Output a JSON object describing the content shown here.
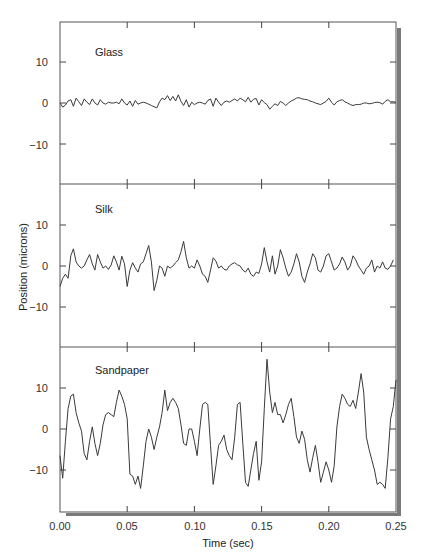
{
  "chart_data": {
    "type": "line",
    "title": "",
    "xlabel": "Time (sec)",
    "ylabel": "Position (microns)",
    "xlim": [
      0.0,
      0.25
    ],
    "x_ticks": [
      "0.00",
      "0.05",
      "0.10",
      "0.15",
      "0.20",
      "0.25"
    ],
    "x_tick_values": [
      0.0,
      0.05,
      0.1,
      0.15,
      0.2,
      0.25
    ],
    "y_ticks": [
      "10",
      "0",
      "−10"
    ],
    "y_tick_values": [
      10,
      0,
      -10
    ],
    "ylim_per_panel": [
      -19.5,
      19.5
    ],
    "grid": false,
    "legend": null,
    "layout": "3 vertically stacked panels sharing x axis",
    "panels": [
      {
        "name": "Glass",
        "series": {
          "x": [
            0.0,
            0.002,
            0.004,
            0.006,
            0.008,
            0.01,
            0.012,
            0.014,
            0.016,
            0.018,
            0.02,
            0.022,
            0.024,
            0.026,
            0.028,
            0.03,
            0.032,
            0.034,
            0.036,
            0.038,
            0.04,
            0.042,
            0.044,
            0.046,
            0.048,
            0.05,
            0.052,
            0.054,
            0.056,
            0.058,
            0.06,
            0.062,
            0.064,
            0.066,
            0.068,
            0.07,
            0.072,
            0.074,
            0.076,
            0.078,
            0.08,
            0.082,
            0.084,
            0.086,
            0.088,
            0.09,
            0.092,
            0.094,
            0.096,
            0.098,
            0.1,
            0.102,
            0.104,
            0.106,
            0.108,
            0.11,
            0.112,
            0.114,
            0.116,
            0.118,
            0.12,
            0.122,
            0.124,
            0.126,
            0.128,
            0.13,
            0.132,
            0.134,
            0.136,
            0.138,
            0.14,
            0.142,
            0.144,
            0.146,
            0.148,
            0.15,
            0.152,
            0.154,
            0.156,
            0.158,
            0.16,
            0.162,
            0.164,
            0.166,
            0.168,
            0.17,
            0.172,
            0.174,
            0.176,
            0.178,
            0.18,
            0.182,
            0.184,
            0.186,
            0.188,
            0.19,
            0.192,
            0.194,
            0.196,
            0.198,
            0.2,
            0.202,
            0.204,
            0.206,
            0.208,
            0.21,
            0.212,
            0.214,
            0.216,
            0.218,
            0.22,
            0.222,
            0.224,
            0.226,
            0.228,
            0.23,
            0.232,
            0.234,
            0.236,
            0.238,
            0.24,
            0.242,
            0.244,
            0.246,
            0.248,
            0.25
          ],
          "y": [
            0.0,
            -1.0,
            -0.5,
            0.5,
            0.8,
            -0.8,
            1.2,
            0.3,
            -0.6,
            1.0,
            0.2,
            -0.4,
            1.0,
            0.0,
            -0.5,
            0.8,
            0.0,
            -0.3,
            0.2,
            0.0,
            0.0,
            0.2,
            -0.2,
            1.0,
            0.0,
            -0.5,
            0.5,
            -0.8,
            0.6,
            -0.3,
            0.0,
            0.2,
            0.0,
            -0.3,
            -0.6,
            -0.9,
            -1.2,
            0.3,
            1.2,
            0.8,
            1.8,
            0.6,
            1.6,
            0.5,
            2.0,
            0.4,
            -0.6,
            0.8,
            -1.0,
            0.2,
            -0.4,
            0.0,
            0.2,
            0.0,
            -0.3,
            0.6,
            1.0,
            -0.8,
            1.2,
            0.2,
            -0.6,
            0.2,
            0.5,
            0.2,
            0.6,
            1.0,
            0.5,
            1.2,
            0.8,
            0.3,
            1.4,
            0.2,
            0.9,
            1.1,
            -0.5,
            0.8,
            0.1,
            -0.4,
            -1.5,
            -0.8,
            -0.2,
            -0.6,
            0.4,
            0.0,
            -0.6,
            0.0,
            0.5,
            0.8,
            1.2,
            1.3,
            1.0,
            0.9,
            0.8,
            0.5,
            0.3,
            0.0,
            -0.2,
            -0.4,
            0.0,
            0.4,
            1.2,
            0.2,
            -0.5,
            0.3,
            0.6,
            0.8,
            0.3,
            0.0,
            -0.4,
            -0.6,
            -0.4,
            -0.4,
            -0.3,
            0.0,
            0.0,
            -0.2,
            -0.1,
            0.1,
            0.2,
            0.1,
            -0.3,
            0.4,
            0.8,
            0.3,
            0.3,
            0.2
          ]
        }
      },
      {
        "name": "Silk",
        "series": {
          "x": [
            0.0,
            0.002,
            0.004,
            0.006,
            0.008,
            0.01,
            0.012,
            0.014,
            0.016,
            0.018,
            0.02,
            0.022,
            0.024,
            0.026,
            0.028,
            0.03,
            0.032,
            0.034,
            0.036,
            0.038,
            0.04,
            0.042,
            0.044,
            0.046,
            0.048,
            0.05,
            0.052,
            0.054,
            0.056,
            0.058,
            0.06,
            0.062,
            0.064,
            0.066,
            0.068,
            0.07,
            0.072,
            0.074,
            0.076,
            0.078,
            0.08,
            0.082,
            0.084,
            0.086,
            0.088,
            0.09,
            0.092,
            0.094,
            0.096,
            0.098,
            0.1,
            0.102,
            0.104,
            0.106,
            0.108,
            0.11,
            0.112,
            0.114,
            0.116,
            0.118,
            0.12,
            0.122,
            0.124,
            0.126,
            0.128,
            0.13,
            0.132,
            0.134,
            0.136,
            0.138,
            0.14,
            0.142,
            0.144,
            0.146,
            0.148,
            0.15,
            0.152,
            0.154,
            0.156,
            0.158,
            0.16,
            0.162,
            0.164,
            0.166,
            0.168,
            0.17,
            0.172,
            0.174,
            0.176,
            0.178,
            0.18,
            0.182,
            0.184,
            0.186,
            0.188,
            0.19,
            0.192,
            0.194,
            0.196,
            0.198,
            0.2,
            0.202,
            0.204,
            0.206,
            0.208,
            0.21,
            0.212,
            0.214,
            0.216,
            0.218,
            0.22,
            0.222,
            0.224,
            0.226,
            0.228,
            0.23,
            0.232,
            0.234,
            0.236,
            0.238,
            0.24,
            0.242,
            0.244,
            0.246,
            0.248,
            0.25
          ],
          "y": [
            -5.0,
            -3.0,
            -2.0,
            -3.0,
            2.5,
            4.2,
            1.0,
            0.0,
            -0.5,
            0.0,
            1.5,
            2.8,
            0.5,
            -1.0,
            2.8,
            1.0,
            -0.5,
            0.0,
            -0.8,
            0.2,
            2.5,
            1.0,
            -1.0,
            2.4,
            0.5,
            -5.0,
            -1.0,
            0.8,
            -0.5,
            -1.5,
            0.5,
            1.0,
            3.0,
            5.0,
            1.0,
            -6.0,
            -3.5,
            0.0,
            -0.5,
            -2.5,
            0.0,
            -0.5,
            0.0,
            0.8,
            1.5,
            3.5,
            6.0,
            2.0,
            -0.5,
            0.0,
            -0.5,
            1.5,
            0.0,
            -2.0,
            -2.5,
            -4.0,
            -1.0,
            2.0,
            1.2,
            -0.5,
            0.0,
            -0.8,
            -1.0,
            0.0,
            0.5,
            0.8,
            0.3,
            0.0,
            -1.0,
            -1.5,
            -0.5,
            -2.0,
            -2.5,
            -1.5,
            -1.8,
            0.5,
            4.5,
            1.0,
            -1.5,
            2.5,
            -2.0,
            0.0,
            4.0,
            2.0,
            -0.5,
            -2.5,
            -1.5,
            0.5,
            3.0,
            1.0,
            -2.5,
            -4.0,
            -1.5,
            0.5,
            3.0,
            2.0,
            -1.0,
            -1.5,
            0.0,
            2.5,
            3.0,
            1.0,
            -1.0,
            -0.5,
            0.5,
            2.2,
            1.0,
            -1.0,
            0.0,
            2.5,
            1.5,
            0.0,
            -1.0,
            -2.0,
            -0.5,
            0.0,
            1.5,
            -1.5,
            0.0,
            -0.5,
            1.0,
            -0.5,
            -0.8,
            0.0,
            1.5
          ]
        }
      },
      {
        "name": "Sandpaper",
        "series": {
          "x": [
            0.0,
            0.002,
            0.004,
            0.006,
            0.008,
            0.01,
            0.012,
            0.014,
            0.016,
            0.018,
            0.02,
            0.022,
            0.024,
            0.026,
            0.028,
            0.03,
            0.032,
            0.034,
            0.036,
            0.038,
            0.04,
            0.042,
            0.044,
            0.046,
            0.048,
            0.05,
            0.052,
            0.054,
            0.056,
            0.058,
            0.06,
            0.062,
            0.064,
            0.066,
            0.068,
            0.07,
            0.072,
            0.074,
            0.076,
            0.078,
            0.08,
            0.082,
            0.084,
            0.086,
            0.088,
            0.09,
            0.092,
            0.094,
            0.096,
            0.098,
            0.1,
            0.102,
            0.104,
            0.106,
            0.108,
            0.11,
            0.112,
            0.114,
            0.116,
            0.118,
            0.12,
            0.122,
            0.124,
            0.126,
            0.128,
            0.13,
            0.132,
            0.134,
            0.136,
            0.138,
            0.14,
            0.142,
            0.144,
            0.146,
            0.148,
            0.15,
            0.152,
            0.154,
            0.156,
            0.158,
            0.16,
            0.162,
            0.164,
            0.166,
            0.168,
            0.17,
            0.172,
            0.174,
            0.176,
            0.178,
            0.18,
            0.182,
            0.184,
            0.186,
            0.188,
            0.19,
            0.192,
            0.194,
            0.196,
            0.198,
            0.2,
            0.202,
            0.204,
            0.206,
            0.208,
            0.21,
            0.212,
            0.214,
            0.216,
            0.218,
            0.22,
            0.222,
            0.224,
            0.226,
            0.228,
            0.23,
            0.232,
            0.234,
            0.236,
            0.238,
            0.24,
            0.242,
            0.244,
            0.246,
            0.248,
            0.25
          ],
          "y": [
            -6.5,
            -12.0,
            -3.0,
            5.0,
            8.0,
            8.5,
            4.0,
            1.5,
            -0.5,
            -6.0,
            -7.5,
            -3.0,
            0.5,
            -3.5,
            -6.5,
            -3.5,
            1.0,
            3.5,
            4.0,
            3.5,
            3.0,
            6.5,
            9.5,
            8.0,
            6.0,
            2.5,
            -11.0,
            -11.5,
            -13.5,
            -11.5,
            -14.5,
            -9.0,
            -3.0,
            0.0,
            -2.0,
            -5.0,
            -2.0,
            0.5,
            4.0,
            9.5,
            4.5,
            6.5,
            7.5,
            6.5,
            5.0,
            1.0,
            -3.5,
            -4.0,
            0.0,
            0.0,
            -3.0,
            -6.5,
            0.0,
            6.0,
            6.5,
            6.0,
            -4.0,
            -13.5,
            -9.0,
            -4.0,
            -3.0,
            -1.5,
            -5.0,
            -6.5,
            -7.5,
            -2.0,
            6.0,
            6.5,
            -3.5,
            -13.0,
            -14.0,
            -10.0,
            -6.0,
            -3.0,
            -12.5,
            -8.0,
            5.0,
            17.0,
            9.0,
            4.0,
            6.5,
            3.5,
            3.5,
            1.5,
            3.5,
            6.0,
            7.5,
            3.0,
            -2.0,
            -3.5,
            -0.5,
            -2.5,
            -7.5,
            -10.5,
            -7.0,
            -4.0,
            -8.0,
            -13.0,
            -10.5,
            -8.0,
            -10.0,
            -13.0,
            -9.0,
            0.5,
            5.5,
            8.5,
            7.5,
            6.0,
            5.5,
            7.0,
            5.0,
            9.0,
            13.5,
            9.0,
            -2.0,
            -5.0,
            -7.5,
            -10.0,
            -13.5,
            -13.0,
            -13.5,
            -14.5,
            -7.0,
            2.5,
            5.5,
            12.0,
            18.0,
            12.0,
            7.0
          ]
        }
      }
    ]
  },
  "figure": {
    "panels": [
      {
        "label": "Glass"
      },
      {
        "label": "Silk"
      },
      {
        "label": "Sandpaper"
      }
    ],
    "xlabel": "Time (sec)",
    "ylabel": "Position (microns)",
    "x_tick_labels": [
      "0.00",
      "0.05",
      "0.10",
      "0.15",
      "0.20",
      "0.25"
    ],
    "y_tick_labels": [
      "10",
      "0",
      "−10"
    ],
    "colors": {
      "line": "#3a3a3a",
      "frame": "#555555",
      "shadow": "#7a7a7a",
      "background": "#ffffff"
    }
  }
}
